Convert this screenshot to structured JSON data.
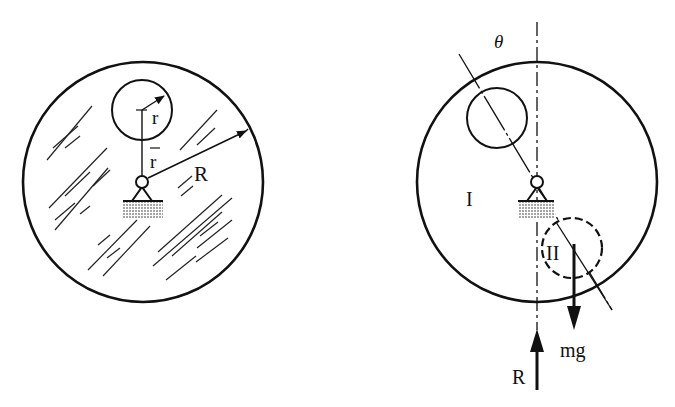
{
  "figure_left": {
    "labels": {
      "small_radius": "r",
      "offset": "r",
      "large_radius": "R"
    },
    "description": "Shaded disk of radius R with a circular hole of radius r offset by r-bar above pivot"
  },
  "figure_right": {
    "labels": {
      "angle": "θ",
      "region_one": "I",
      "region_two": "II",
      "weight": "mg",
      "reaction": "R"
    },
    "description": "Disk rotated by angle θ; hole position and equivalent negative mass II with weight mg and reaction R"
  },
  "colors": {
    "ink": "#111111",
    "background": "#ffffff"
  }
}
